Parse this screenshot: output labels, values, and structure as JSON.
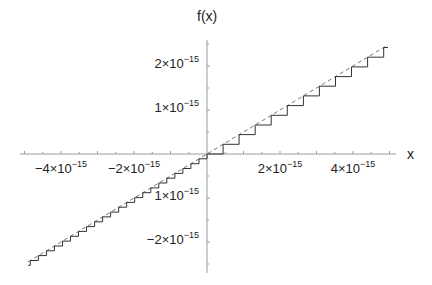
{
  "chart_data": {
    "type": "line",
    "title": "",
    "xlabel": "x",
    "ylabel": "f(x)",
    "xlim": [
      -5.1e-15,
      5e-15
    ],
    "ylim": [
      -2.7e-15,
      2.5e-15
    ],
    "grid": false,
    "legend": null,
    "x_ticks": [
      {
        "value": -4e-15,
        "mantissa": "−4",
        "exp": "−15"
      },
      {
        "value": -2e-15,
        "mantissa": "−2",
        "exp": "−15"
      },
      {
        "value": 2e-15,
        "mantissa": "2",
        "exp": "−15"
      },
      {
        "value": 4e-15,
        "mantissa": "4",
        "exp": "−15"
      }
    ],
    "y_ticks": [
      {
        "value": 2e-15,
        "mantissa": "2",
        "exp": "−15"
      },
      {
        "value": 1e-15,
        "mantissa": "1",
        "exp": "−15"
      },
      {
        "value": -1e-15,
        "mantissa": "1",
        "exp": "−15"
      },
      {
        "value": -2e-15,
        "mantissa": "−2",
        "exp": "−15"
      }
    ],
    "series": [
      {
        "name": "exact",
        "style": "dashed",
        "color": "#777777",
        "function": "f(x) = x/2",
        "x": [
          -4.9e-15,
          4.96e-15
        ],
        "y": [
          -2.45e-15,
          2.48e-15
        ]
      },
      {
        "name": "floating-point staircase",
        "style": "solid-step",
        "color": "#333333",
        "positive_step_width": 4.4e-16,
        "positive_step_height": 2.2e-16,
        "negative_step_width": 2.2e-16,
        "negative_step_height": 1.1e-16,
        "x_range": [
          -4.9e-15,
          4.96e-15
        ]
      }
    ]
  },
  "labels": {
    "y_axis_title": "f(x)",
    "x_axis_title": "x",
    "times": "×10"
  }
}
